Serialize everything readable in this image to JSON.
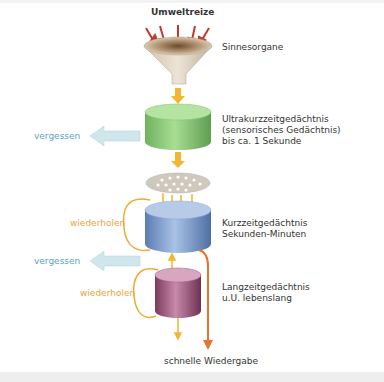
{
  "diagram": {
    "title": "Umweltreize",
    "stages": [
      {
        "id": "sinnesorgane",
        "label": "Sinnesorgane"
      },
      {
        "id": "ultrakurzzeit",
        "lines": [
          "Ultrakurzzeitgedächtnis",
          "(sensorisches Gedächtnis)",
          "bis ca. 1 Sekunde"
        ]
      },
      {
        "id": "kurzzeit",
        "lines": [
          "Kurzzeitgedächtnis",
          "Sekunden-Minuten"
        ]
      },
      {
        "id": "langzeit",
        "lines": [
          "Langzeitgedächtnis",
          "u.U. lebenslang"
        ]
      }
    ],
    "side_labels": {
      "vergessen_1": "vergessen",
      "wiederholen_1": "wiederholen",
      "vergessen_2": "vergessen",
      "wiederholen_2": "wiederholen"
    },
    "bottom_label": "schnelle Wiedergabe",
    "colors": {
      "stimulus_arrow": "#c0392b",
      "flow_arrow": "#f2b632",
      "forget_arrow": "#cfe6ec",
      "loop": "#f0a830",
      "retrieval_arrow": "#e8732a",
      "sensory_cylinder": "#8fcf7e",
      "short_term_cylinder": "#7d9ccc",
      "long_term_cylinder": "#a5587f",
      "funnel": "#d8cdb8",
      "filter": "#cfc8bd"
    }
  }
}
